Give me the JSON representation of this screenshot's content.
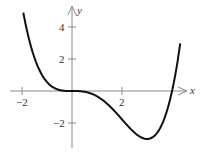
{
  "chart_data": {
    "type": "line",
    "title": "",
    "xlabel": "x",
    "ylabel": "y",
    "function": "y = x^3(x-4)/9",
    "xlim": [
      -2.2,
      4.4
    ],
    "ylim": [
      -3.6,
      5.5
    ],
    "grid": false,
    "legend": null,
    "x_ticks": [
      -2,
      2
    ],
    "y_ticks": [
      -2,
      2,
      4
    ],
    "x_tick_labels": [
      "-2",
      "2"
    ],
    "y_tick_labels": [
      "-2",
      "2",
      "4"
    ],
    "series": [
      {
        "name": "f(x)",
        "x": [
          -2,
          -1.5,
          -1,
          -0.5,
          0,
          0.5,
          1,
          1.5,
          2,
          2.5,
          3,
          3.5,
          3.8,
          4,
          4.3
        ],
        "values": [
          5.33,
          2.06,
          0.56,
          0.06,
          0,
          -0.05,
          -0.33,
          -0.94,
          -1.78,
          -2.6,
          -3.0,
          -2.38,
          -1.22,
          0,
          2.65
        ]
      }
    ],
    "annotations": [
      {
        "type": "local-minimum",
        "x": 3,
        "y": -3
      }
    ]
  },
  "labels": {
    "x_axis": "x",
    "y_axis": "y",
    "tick_x_neg2": "−2",
    "tick_x_2": "2",
    "tick_y_4": "4",
    "tick_y_2": "2",
    "tick_y_neg2": "−2"
  },
  "colors": {
    "curve": "#111111",
    "axis": "#888888",
    "text": "#333333"
  }
}
